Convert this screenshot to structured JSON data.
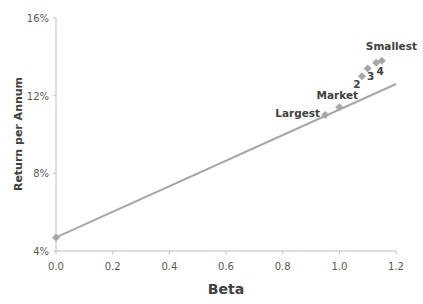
{
  "chart_data": {
    "type": "scatter",
    "title": "",
    "xlabel": "Beta",
    "ylabel": "Return per Annum",
    "xlim": [
      0.0,
      1.2
    ],
    "ylim": [
      0.04,
      0.16
    ],
    "x_ticks": [
      "0.0",
      "0.2",
      "0.4",
      "0.6",
      "0.8",
      "1.0",
      "1.2"
    ],
    "y_ticks": [
      "4%",
      "8%",
      "12%",
      "16%"
    ],
    "grid": false,
    "legend": null,
    "series": [
      {
        "name": "Portfolios",
        "marker": "diamond",
        "color": "#A6A6A6",
        "points": [
          {
            "label": "",
            "x": 0.0,
            "y": 0.047
          },
          {
            "label": "Largest",
            "x": 0.95,
            "y": 0.11
          },
          {
            "label": "Market",
            "x": 1.0,
            "y": 0.114
          },
          {
            "label": "2",
            "x": 1.08,
            "y": 0.13
          },
          {
            "label": "3",
            "x": 1.1,
            "y": 0.134
          },
          {
            "label": "4",
            "x": 1.13,
            "y": 0.137
          },
          {
            "label": "Smallest",
            "x": 1.15,
            "y": 0.138
          }
        ]
      },
      {
        "name": "Security Market Line",
        "type": "line",
        "color": "#A6A6A6",
        "x": [
          0.0,
          1.2
        ],
        "y": [
          0.047,
          0.126
        ]
      }
    ]
  },
  "labels": {
    "x_axis_title": "Beta",
    "y_axis_title": "Return per Annum"
  }
}
